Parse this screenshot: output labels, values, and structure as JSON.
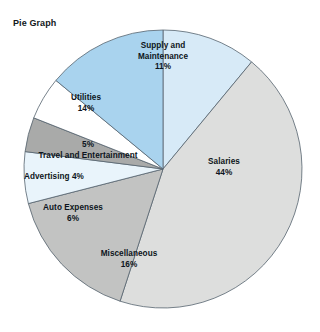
{
  "chart_data": {
    "type": "pie",
    "title": "Pie Graph",
    "xlabel": "",
    "ylabel": "",
    "legend_position": "none",
    "grid": false,
    "unit": "%",
    "start_angle_deg": 0,
    "direction": "clockwise",
    "categories": [
      "Supply and Maintenance",
      "Salaries",
      "Miscellaneous",
      "Auto Expenses",
      "Advertising",
      "Travel and Entertainment",
      "Utilities"
    ],
    "values": [
      11,
      44,
      16,
      6,
      4,
      5,
      14
    ],
    "colors": [
      "#d7eaf7",
      "#dddedd",
      "#c2c3c2",
      "#e9f4fb",
      "#a9aaa9",
      "#ffffff",
      "#a9d3ee"
    ],
    "slices": [
      {
        "label": "Supply and Maintenance",
        "label_line1": "Supply and",
        "label_line2": "Maintenance",
        "value": 11,
        "percent_text": "11%",
        "color": "#d7eaf7"
      },
      {
        "label": "Salaries",
        "label_line1": "Salaries",
        "label_line2": "",
        "value": 44,
        "percent_text": "44%",
        "color": "#dddedd"
      },
      {
        "label": "Miscellaneous",
        "label_line1": "Miscellaneous",
        "label_line2": "",
        "value": 16,
        "percent_text": "16%",
        "color": "#c2c3c2"
      },
      {
        "label": "Auto Expenses",
        "label_line1": "Auto Expenses",
        "label_line2": "",
        "value": 6,
        "percent_text": "6%",
        "color": "#e9f4fb"
      },
      {
        "label": "Advertising",
        "label_line1": "Advertising",
        "label_line2": "",
        "value": 4,
        "percent_text": "4%",
        "color": "#a9aaa9"
      },
      {
        "label": "Travel and Entertainment",
        "label_line1": "Travel and Entertainment",
        "label_line2": "",
        "value": 5,
        "percent_text": "5%",
        "color": "#ffffff"
      },
      {
        "label": "Utilities",
        "label_line1": "Utilities",
        "label_line2": "",
        "value": 14,
        "percent_text": "14%",
        "color": "#a9d3ee"
      }
    ],
    "geometry": {
      "center_x": 163,
      "center_y": 169,
      "radius": 139,
      "stroke_color": "#56636e",
      "stroke_width": 0.8
    }
  },
  "labels": {
    "supply": {
      "line1": "Supply and",
      "line2": "Maintenance",
      "pct": "11%"
    },
    "salaries": {
      "line1": "Salaries",
      "pct": "44%"
    },
    "miscellaneous": {
      "line1": "Miscellaneous",
      "pct": "16%"
    },
    "auto_expenses": {
      "line1": "Auto Expenses",
      "pct": "6%"
    },
    "advertising": {
      "line1": "Advertising",
      "pct": "4%"
    },
    "travel": {
      "line1": "Travel and Entertainment",
      "pct": "5%"
    },
    "utilities": {
      "line1": "Utilities",
      "pct": "14%"
    }
  }
}
